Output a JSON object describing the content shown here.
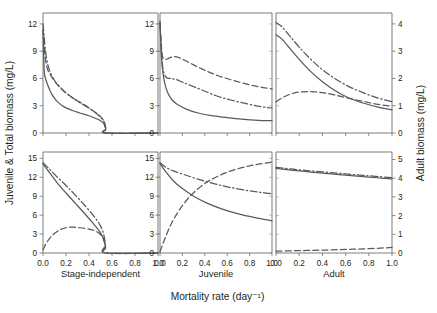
{
  "chart_data": {
    "type": "line",
    "title": "",
    "xlabel": "Mortality rate (day⁻¹)",
    "ylabel_left": "Juvenile & Total biomass (mg/L)",
    "ylabel_right": "Adult biomass (mg/L)",
    "grid": false,
    "legend_position": "none",
    "series_styles": [
      "solid",
      "dashed",
      "dash-dot"
    ],
    "column_labels": [
      "Stage-independent",
      "Juvenile",
      "Adult"
    ],
    "x_ticks": [
      "0.0",
      "0.2",
      "0.4",
      "0.6",
      "0.8",
      "1.0"
    ],
    "x_tick_values": [
      0.0,
      0.2,
      0.4,
      0.6,
      0.8,
      1.0
    ],
    "xlim": [
      0.0,
      1.0
    ],
    "panels": [
      {
        "row": 0,
        "col": 0,
        "column_label": "Stage-independent",
        "axis": "left",
        "y_ticks": [
          "0",
          "3",
          "6",
          "9",
          "12"
        ],
        "y_tick_values": [
          0,
          3,
          6,
          9,
          12
        ],
        "ylim": [
          0,
          13.2
        ],
        "series": [
          {
            "name": "solid",
            "style": "solid",
            "x": [
              0.0,
              0.01,
              0.02,
              0.04,
              0.06,
              0.08,
              0.12,
              0.18,
              0.25,
              0.32,
              0.4,
              0.46,
              0.5,
              0.53,
              0.545,
              0.55,
              1.0
            ],
            "y": [
              11.2,
              7.0,
              6.1,
              5.3,
              4.7,
              4.2,
              3.5,
              2.9,
              2.5,
              2.2,
              1.9,
              1.6,
              1.35,
              1.0,
              0.45,
              0.0,
              0.0
            ]
          },
          {
            "name": "dashed",
            "style": "dashed",
            "x": [
              0.0,
              0.01,
              0.02,
              0.04,
              0.06,
              0.09,
              0.14,
              0.2,
              0.28,
              0.36,
              0.44,
              0.5,
              0.53,
              0.545,
              0.55,
              1.0
            ],
            "y": [
              11.4,
              10.0,
              8.2,
              7.0,
              6.5,
              5.9,
              5.1,
              4.4,
              3.7,
              3.1,
              2.4,
              1.8,
              1.3,
              0.5,
              0.0,
              0.0
            ]
          },
          {
            "name": "dashdot",
            "style": "dash-dot",
            "x": [
              0.0,
              0.01,
              0.02,
              0.04,
              0.07,
              0.11,
              0.16,
              0.22,
              0.3,
              0.38,
              0.46,
              0.51,
              0.535,
              0.548,
              0.55,
              1.0
            ],
            "y": [
              12.0,
              10.6,
              9.2,
              7.6,
              6.5,
              5.6,
              4.9,
              4.2,
              3.5,
              2.9,
              2.2,
              1.6,
              1.1,
              0.4,
              0.0,
              0.0
            ]
          }
        ]
      },
      {
        "row": 0,
        "col": 1,
        "column_label": "Juvenile",
        "axis": "left",
        "y_ticks": [
          "0",
          "3",
          "6",
          "9",
          "12"
        ],
        "y_tick_values": [
          0,
          3,
          6,
          9,
          12
        ],
        "ylim": [
          0,
          13.2
        ],
        "series": [
          {
            "name": "solid",
            "style": "solid",
            "x": [
              0.0,
              0.01,
              0.02,
              0.04,
              0.07,
              0.11,
              0.16,
              0.24,
              0.34,
              0.46,
              0.6,
              0.75,
              0.88,
              1.0
            ],
            "y": [
              12.2,
              9.0,
              7.3,
              5.6,
              4.4,
              3.6,
              3.1,
              2.6,
              2.2,
              1.9,
              1.7,
              1.5,
              1.4,
              1.35
            ]
          },
          {
            "name": "dashed",
            "style": "dashed",
            "x": [
              0.0,
              0.02,
              0.05,
              0.09,
              0.13,
              0.17,
              0.22,
              0.3,
              0.4,
              0.52,
              0.65,
              0.8,
              0.92,
              1.0
            ],
            "y": [
              11.9,
              8.6,
              8.1,
              8.3,
              8.4,
              8.3,
              8.0,
              7.5,
              6.9,
              6.3,
              5.8,
              5.3,
              5.0,
              4.85
            ]
          },
          {
            "name": "dashdot",
            "style": "dash-dot",
            "x": [
              0.0,
              0.02,
              0.05,
              0.09,
              0.14,
              0.2,
              0.28,
              0.38,
              0.5,
              0.64,
              0.78,
              0.9,
              1.0
            ],
            "y": [
              12.3,
              7.7,
              6.2,
              6.0,
              5.9,
              5.6,
              5.2,
              4.7,
              4.1,
              3.6,
              3.2,
              2.9,
              2.75
            ]
          }
        ]
      },
      {
        "row": 0,
        "col": 2,
        "column_label": "Adult",
        "axis": "right",
        "y_ticks": [
          "0",
          "1",
          "2",
          "3",
          "4"
        ],
        "y_tick_values": [
          0,
          1,
          2,
          3,
          4
        ],
        "ylim": [
          0,
          4.4
        ],
        "series": [
          {
            "name": "solid",
            "style": "solid",
            "x": [
              0.0,
              0.05,
              0.12,
              0.2,
              0.3,
              0.4,
              0.5,
              0.62,
              0.75,
              0.88,
              1.0
            ],
            "y": [
              3.6,
              3.45,
              3.1,
              2.7,
              2.25,
              1.88,
              1.58,
              1.3,
              1.1,
              0.95,
              0.85
            ]
          },
          {
            "name": "dashed",
            "style": "dashed",
            "x": [
              0.0,
              0.05,
              0.12,
              0.2,
              0.3,
              0.4,
              0.5,
              0.62,
              0.75,
              0.88,
              1.0
            ],
            "y": [
              1.15,
              1.28,
              1.42,
              1.5,
              1.52,
              1.48,
              1.4,
              1.28,
              1.16,
              1.05,
              0.98
            ]
          },
          {
            "name": "dashdot",
            "style": "dash-dot",
            "x": [
              0.0,
              0.05,
              0.12,
              0.2,
              0.3,
              0.4,
              0.5,
              0.62,
              0.75,
              0.88,
              1.0
            ],
            "y": [
              4.05,
              3.9,
              3.55,
              3.15,
              2.7,
              2.32,
              2.02,
              1.72,
              1.48,
              1.28,
              1.15
            ]
          }
        ]
      },
      {
        "row": 1,
        "col": 0,
        "column_label": "Stage-independent",
        "axis": "left",
        "y_ticks": [
          "0",
          "3",
          "6",
          "9",
          "12",
          "15"
        ],
        "y_tick_values": [
          0,
          3,
          6,
          9,
          12,
          15
        ],
        "ylim": [
          0,
          16.0
        ],
        "series": [
          {
            "name": "solid",
            "style": "solid",
            "x": [
              0.0,
              0.05,
              0.12,
              0.2,
              0.28,
              0.36,
              0.44,
              0.5,
              0.53,
              0.545,
              0.55,
              1.0
            ],
            "y": [
              14.1,
              12.9,
              11.2,
              9.5,
              7.9,
              6.3,
              4.6,
              3.2,
              2.1,
              0.8,
              0.0,
              0.0
            ]
          },
          {
            "name": "dashed",
            "style": "dashed",
            "x": [
              0.0,
              0.03,
              0.08,
              0.14,
              0.2,
              0.26,
              0.32,
              0.38,
              0.44,
              0.49,
              0.52,
              0.54,
              0.55,
              1.0
            ],
            "y": [
              0.5,
              1.6,
              2.8,
              3.6,
              4.0,
              4.1,
              4.0,
              3.85,
              3.6,
              3.1,
              2.4,
              1.2,
              0.0,
              0.0
            ]
          },
          {
            "name": "dashdot",
            "style": "dash-dot",
            "x": [
              0.0,
              0.05,
              0.12,
              0.2,
              0.28,
              0.36,
              0.44,
              0.5,
              0.53,
              0.545,
              0.55,
              1.0
            ],
            "y": [
              14.3,
              13.4,
              12.1,
              10.7,
              9.2,
              7.6,
              5.9,
              4.3,
              2.8,
              1.0,
              0.0,
              0.0
            ]
          }
        ]
      },
      {
        "row": 1,
        "col": 1,
        "column_label": "Juvenile",
        "axis": "left",
        "y_ticks": [
          "0",
          "3",
          "6",
          "9",
          "12",
          "15"
        ],
        "y_tick_values": [
          0,
          3,
          6,
          9,
          12,
          15
        ],
        "ylim": [
          0,
          16.0
        ],
        "series": [
          {
            "name": "solid",
            "style": "solid",
            "x": [
              0.0,
              0.05,
              0.12,
              0.2,
              0.3,
              0.42,
              0.55,
              0.7,
              0.85,
              1.0
            ],
            "y": [
              14.2,
              12.9,
              11.4,
              10.2,
              9.0,
              7.9,
              7.0,
              6.2,
              5.6,
              5.1
            ]
          },
          {
            "name": "dashed",
            "style": "dashed",
            "x": [
              0.0,
              0.04,
              0.1,
              0.18,
              0.28,
              0.4,
              0.52,
              0.65,
              0.8,
              0.92,
              1.0
            ],
            "y": [
              0.2,
              2.1,
              4.6,
              7.0,
              9.2,
              11.0,
              12.2,
              13.1,
              13.8,
              14.2,
              14.4
            ]
          },
          {
            "name": "dashdot",
            "style": "dash-dot",
            "x": [
              0.0,
              0.05,
              0.12,
              0.22,
              0.34,
              0.48,
              0.62,
              0.78,
              0.9,
              1.0
            ],
            "y": [
              14.3,
              13.6,
              13.0,
              12.4,
              11.7,
              11.0,
              10.4,
              9.9,
              9.6,
              9.4
            ]
          }
        ]
      },
      {
        "row": 1,
        "col": 2,
        "column_label": "Adult",
        "axis": "right",
        "y_ticks": [
          "0",
          "1",
          "2",
          "3",
          "4",
          "5"
        ],
        "y_tick_values": [
          0,
          1,
          2,
          3,
          4,
          5
        ],
        "ylim": [
          0,
          5.4
        ],
        "series": [
          {
            "name": "solid",
            "style": "solid",
            "x": [
              0.0,
              0.15,
              0.3,
              0.45,
              0.6,
              0.75,
              0.9,
              1.0
            ],
            "y": [
              4.52,
              4.42,
              4.33,
              4.24,
              4.16,
              4.08,
              4.01,
              3.96
            ]
          },
          {
            "name": "dashed",
            "style": "dashed",
            "x": [
              0.0,
              0.15,
              0.3,
              0.45,
              0.6,
              0.75,
              0.9,
              1.0
            ],
            "y": [
              0.1,
              0.12,
              0.14,
              0.16,
              0.19,
              0.22,
              0.26,
              0.3
            ]
          },
          {
            "name": "dashdot",
            "style": "dash-dot",
            "x": [
              0.0,
              0.15,
              0.3,
              0.45,
              0.6,
              0.75,
              0.9,
              1.0
            ],
            "y": [
              4.58,
              4.48,
              4.39,
              4.31,
              4.23,
              4.15,
              4.08,
              4.03
            ]
          }
        ]
      }
    ]
  }
}
